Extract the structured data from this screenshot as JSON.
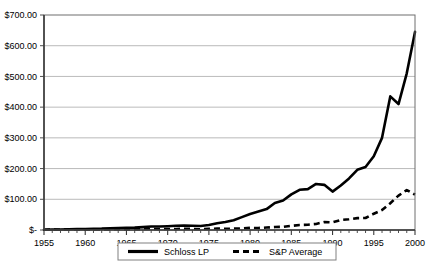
{
  "chart_data": {
    "type": "line",
    "title": "",
    "xlabel": "",
    "ylabel": "",
    "xlim": [
      1955,
      2000
    ],
    "ylim": [
      0,
      700
    ],
    "grid": true,
    "legend_position": "bottom-center",
    "y_tick_labels": [
      "$700.00",
      "$600.00",
      "$500.00",
      "$400.00",
      "$300.00",
      "$200.00",
      "$100.00",
      "$-"
    ],
    "y_tick_values": [
      700,
      600,
      500,
      400,
      300,
      200,
      100,
      0
    ],
    "x_tick_labels": [
      "1955",
      "1960",
      "1965",
      "1970",
      "1975",
      "1980",
      "1985",
      "1990",
      "1995",
      "2000"
    ],
    "x_tick_values": [
      1955,
      1960,
      1965,
      1970,
      1975,
      1980,
      1985,
      1990,
      1995,
      2000
    ],
    "x_minor_step": 1,
    "x": [
      1955,
      1956,
      1957,
      1958,
      1959,
      1960,
      1961,
      1962,
      1963,
      1964,
      1965,
      1966,
      1967,
      1968,
      1969,
      1970,
      1971,
      1972,
      1973,
      1974,
      1975,
      1976,
      1977,
      1978,
      1979,
      1980,
      1981,
      1982,
      1983,
      1984,
      1985,
      1986,
      1987,
      1988,
      1989,
      1990,
      1991,
      1992,
      1993,
      1994,
      1995,
      1996,
      1997,
      1998,
      1999,
      2000
    ],
    "series": [
      {
        "name": "Schloss LP",
        "style": "solid",
        "values": [
          1,
          1.5,
          1.8,
          2.6,
          3.1,
          3.4,
          4.2,
          4.4,
          5.4,
          6.2,
          7.4,
          7.6,
          9.5,
          11.5,
          11.2,
          12.4,
          13.8,
          14.6,
          13.9,
          13.2,
          16.5,
          22,
          26,
          32,
          42,
          52,
          60,
          68,
          88,
          96,
          116,
          131,
          133,
          150,
          147,
          125,
          145,
          168,
          196,
          205,
          240,
          300,
          435,
          410,
          510,
          645
        ]
      },
      {
        "name": "S&P Average",
        "style": "dashed",
        "values": [
          1,
          1.1,
          1,
          1.4,
          1.5,
          1.5,
          1.9,
          1.7,
          2.1,
          2.4,
          2.7,
          2.4,
          3,
          3.3,
          3,
          3.1,
          3.5,
          4.2,
          3.6,
          2.6,
          3.6,
          4.5,
          4.1,
          4.4,
          5.2,
          6.9,
          6.5,
          7.9,
          9.7,
          10.3,
          13.6,
          16.1,
          17,
          19.8,
          26,
          25,
          32.6,
          35,
          38.6,
          39,
          53,
          65,
          87,
          112,
          130,
          115
        ]
      }
    ],
    "legend": [
      {
        "label": "Schloss LP",
        "style": "solid"
      },
      {
        "label": "S&P Average",
        "style": "dashed"
      }
    ]
  }
}
